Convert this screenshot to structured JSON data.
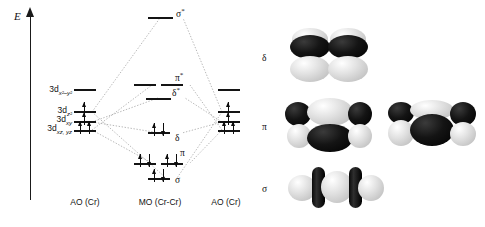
{
  "figure": {
    "type": "molecular-orbital-diagram",
    "system": "Cr-Cr quadruple bond",
    "energy_axis_label": "E"
  },
  "columns": {
    "left_caption": "AO (Cr)",
    "center_caption": "MO (Cr-Cr)",
    "right_caption": "AO (Cr)"
  },
  "ao_levels": [
    {
      "id": "dx2y2",
      "label_main": "3d",
      "label_sub": "x²–y²",
      "electrons": 0
    },
    {
      "id": "dz2",
      "label_main": "3d",
      "label_sub": "z²",
      "electrons": 1
    },
    {
      "id": "dxy",
      "label_main": "3d",
      "label_sub": "xy",
      "electrons": 1
    },
    {
      "id": "dxzyz",
      "label_main": "3d",
      "label_sub": "xz, yz",
      "electrons": 2
    }
  ],
  "mo_levels": [
    {
      "id": "sigma-star",
      "label": "σ",
      "star": "*",
      "degeneracy": 1,
      "electron_pairs": 0
    },
    {
      "id": "pi-star",
      "label": "π",
      "star": "*",
      "degeneracy": 2,
      "electron_pairs": 0
    },
    {
      "id": "delta-star",
      "label": "δ",
      "star": "*",
      "degeneracy": 1,
      "electron_pairs": 0
    },
    {
      "id": "delta",
      "label": "δ",
      "star": "",
      "degeneracy": 1,
      "electron_pairs": 1
    },
    {
      "id": "pi",
      "label": "π",
      "star": "",
      "degeneracy": 2,
      "electron_pairs": 2
    },
    {
      "id": "sigma",
      "label": "σ",
      "star": "",
      "degeneracy": 1,
      "electron_pairs": 1
    }
  ],
  "orbital_pictures": [
    {
      "id": "delta-picture",
      "label": "δ",
      "description": "delta bond: stacked dark upper and light lower four-lobe cloverleaf pair"
    },
    {
      "id": "pi-picture",
      "label": "π",
      "description": "two pi bonds shown side by side, alternating dark and light lobes"
    },
    {
      "id": "sigma-picture",
      "label": "σ",
      "description": "sigma bond: light spheres separated by dark nodal discs along the bond axis"
    }
  ],
  "colors": {
    "ink": "#141414",
    "dark_lobe": "#000000",
    "light_lobe": "#d8d8d8",
    "background": "#ffffff"
  }
}
